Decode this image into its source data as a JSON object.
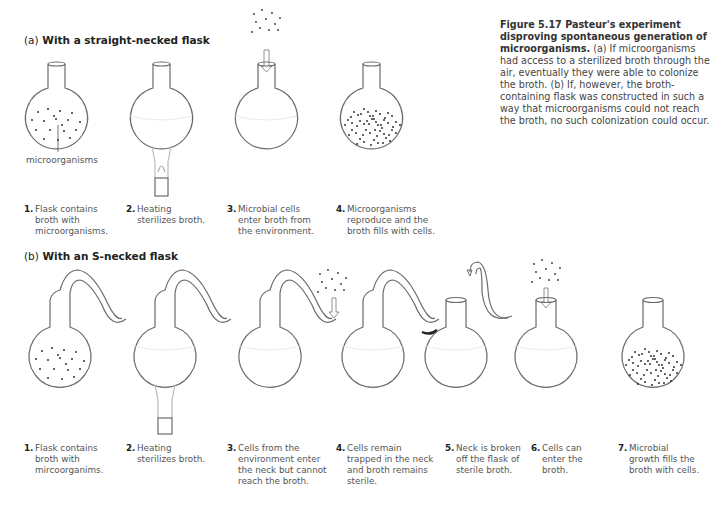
{
  "caption": {
    "title": "Figure 5.17 Pasteur's experiment disproving spontaneous generation of microorganisms.",
    "body": "(a) If microorganisms had access to a sterilized broth through the air, eventually they were able to colonize the broth. (b) If, however, the broth-containing flask was constructed in such a way that microorganisms could not reach the broth, no such colonization could occur."
  },
  "panel_a": {
    "letter": "(a)",
    "title": "With a straight-necked flask",
    "pointer_label": "microorganisms",
    "steps": [
      {
        "num": "1.",
        "text": "Flask contains\nbroth with\nmicroorganisms."
      },
      {
        "num": "2.",
        "text": "Heating\nsterilizes broth."
      },
      {
        "num": "3.",
        "text": "Microbial cells\nenter broth from\nthe environment."
      },
      {
        "num": "4.",
        "text": "Microorganisms\nreproduce and the\nbroth fills with cells."
      }
    ]
  },
  "panel_b": {
    "letter": "(b)",
    "title": "With an S-necked flask",
    "steps": [
      {
        "num": "1.",
        "text": "Flask contains\nbroth with\nmircoorganims."
      },
      {
        "num": "2.",
        "text": "Heating\nsterilizes broth."
      },
      {
        "num": "3.",
        "text": "Cells from the\nenvironment enter\nthe neck but cannot\nreach the broth."
      },
      {
        "num": "4.",
        "text": "Cells remain\ntrapped in the neck\nand broth remains\nsterile."
      },
      {
        "num": "5.",
        "text": "Neck is broken\noff the flask of\nsterile broth."
      },
      {
        "num": "6.",
        "text": "Cells can\nenter the\nbroth."
      },
      {
        "num": "7.",
        "text": "Microbial\ngrowth fills the\nbroth with cells."
      }
    ]
  },
  "colors": {
    "outline": "#6b6b6b",
    "dots": "#333333",
    "text": "#333333"
  }
}
